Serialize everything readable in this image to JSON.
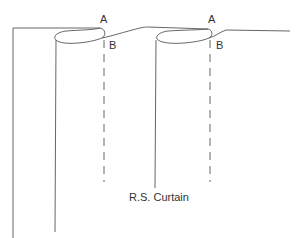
{
  "diagram": {
    "labels": {
      "a1": "A",
      "b1": "B",
      "a2": "A",
      "b2": "B",
      "caption": "R.S. Curtain"
    },
    "colors": {
      "line": "#555555",
      "text": "#333333",
      "background": "#ffffff"
    },
    "elements": [
      "curtain-outer-edge",
      "pleat-1-fold",
      "pleat-1-stitch-line",
      "pleat-2-fold",
      "pleat-2-stitch-line",
      "curtain-top-edge"
    ]
  }
}
